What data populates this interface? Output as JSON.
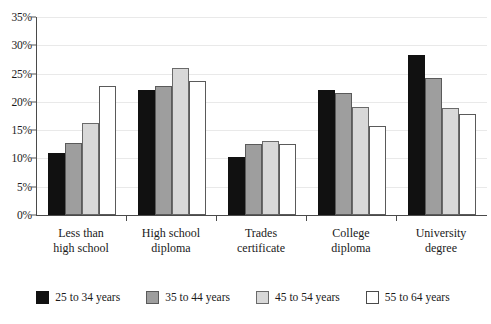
{
  "chart_data": {
    "type": "bar",
    "title": "",
    "subtitle": "",
    "xlabel": "",
    "ylabel": "",
    "ylim": [
      0,
      35
    ],
    "ytick_labels": [
      "0%",
      "5%",
      "10%",
      "15%",
      "20%",
      "25%",
      "30%",
      "35%"
    ],
    "ytick_values": [
      0,
      5,
      10,
      15,
      20,
      25,
      30,
      35
    ],
    "grid": true,
    "legend_position": "bottom",
    "categories": [
      "Less than high school",
      "High school diploma",
      "Trades certificate",
      "College diploma",
      "University degree"
    ],
    "category_lines": [
      [
        "Less than",
        "high school"
      ],
      [
        "High school",
        "diploma"
      ],
      [
        "Trades",
        "certificate"
      ],
      [
        "College",
        "diploma"
      ],
      [
        "University",
        "degree"
      ]
    ],
    "series": [
      {
        "name": "25 to 34 years",
        "color": "#111111",
        "values": [
          11.0,
          22.1,
          10.3,
          22.1,
          28.2
        ]
      },
      {
        "name": "35 to 44 years",
        "color": "#9e9e9e",
        "values": [
          12.8,
          22.8,
          12.6,
          21.6,
          24.2
        ]
      },
      {
        "name": "45 to 54 years",
        "color": "#d8d8d8",
        "values": [
          16.3,
          26.0,
          13.0,
          19.1,
          19.0
        ]
      },
      {
        "name": "55 to 64 years",
        "color": "#ffffff",
        "values": [
          22.8,
          23.7,
          12.6,
          15.7,
          17.8
        ]
      }
    ]
  }
}
